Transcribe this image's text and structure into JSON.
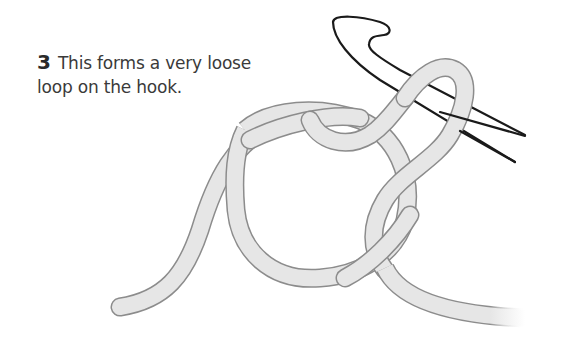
{
  "step": {
    "number": "3",
    "line1": "This forms a very loose",
    "line2": "loop on the hook."
  },
  "illustration": {
    "subject": "crochet-hook-with-yarn-loop",
    "yarn_fill": "#e6e6e6",
    "yarn_outline": "#8c8c8c",
    "hook_outline": "#1a1a1a"
  }
}
